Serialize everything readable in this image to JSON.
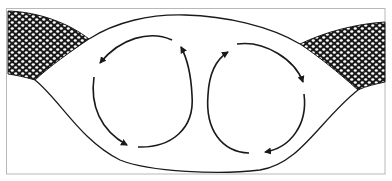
{
  "figure": {
    "kind": "convection-cell-diagram",
    "frame": {
      "x": 6,
      "y": 8,
      "width": 379,
      "height": 166,
      "stroke": "#b8b8b8"
    },
    "colors": {
      "ink": "#1a1a1a",
      "background": "#ffffff",
      "frame": "#b8b8b8"
    },
    "regions": [
      {
        "name": "left-hex-packed-region",
        "pattern": "hexagonal-cells"
      },
      {
        "name": "right-hex-packed-region",
        "pattern": "hexagonal-cells"
      },
      {
        "name": "central-lens-region",
        "pattern": "none"
      }
    ],
    "cells": [
      {
        "name": "left-circulation-cell",
        "rotation": "counterclockwise",
        "arrows": 3
      },
      {
        "name": "right-circulation-cell",
        "rotation": "clockwise",
        "arrows": 3
      }
    ]
  }
}
